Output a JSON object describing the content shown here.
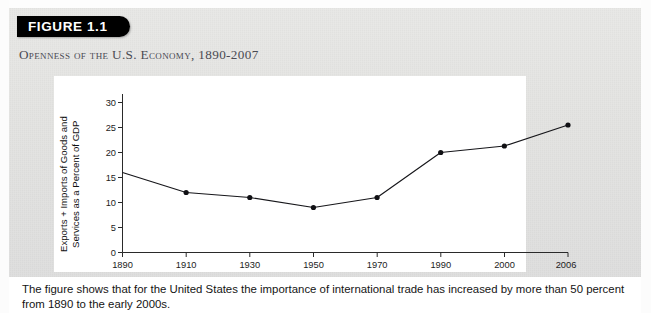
{
  "figure": {
    "banner_label": "FIGURE 1.1",
    "title": "Openness of the U.S. Economy, 1890-2007",
    "caption_lines": [
      "The figure shows that for the United States the importance of international trade has increased by more than 50 percent",
      "from 1890 to the early 2000s."
    ],
    "colors": {
      "banner_background": "#000000",
      "banner_text": "#ffffff",
      "title_text": "#4a4a52",
      "page_background": "#e4e4e2",
      "plot_background": "#ffffff",
      "line": "#16161a",
      "marker": "#101014"
    }
  },
  "chart_data": {
    "type": "line",
    "title": "Openness of the U.S. Economy, 1890-2007",
    "xlabel": "",
    "ylabel": "Exports + Imports of Goods and Services as a Percent of GDP",
    "ylabel_lines": [
      "Exports + Imports of Goods and",
      "Services as a Percent of GDP"
    ],
    "categories": [
      "1890",
      "1910",
      "1930",
      "1950",
      "1970",
      "1990",
      "2000",
      "2006"
    ],
    "values": [
      16.0,
      12.0,
      11.0,
      9.0,
      11.0,
      20.0,
      21.3,
      25.5
    ],
    "series": [
      {
        "name": "Exports + Imports of Goods and Services as a Percent of GDP",
        "values": [
          16.0,
          12.0,
          11.0,
          9.0,
          11.0,
          20.0,
          21.3,
          25.5
        ]
      }
    ],
    "markers_shown": [
      "1910",
      "1930",
      "1950",
      "1970",
      "1990",
      "2000",
      "2006"
    ],
    "ylim": [
      0,
      30
    ],
    "yticks": [
      0,
      5,
      10,
      15,
      20,
      25,
      30
    ],
    "ytick_labels": [
      "0",
      "5",
      "10",
      "15",
      "20",
      "25",
      "30"
    ],
    "xtick_labels": [
      "1890",
      "1910",
      "1930",
      "1950",
      "1970",
      "1990",
      "2000",
      "2006"
    ],
    "grid": false,
    "legend": false,
    "legend_position": "none"
  }
}
